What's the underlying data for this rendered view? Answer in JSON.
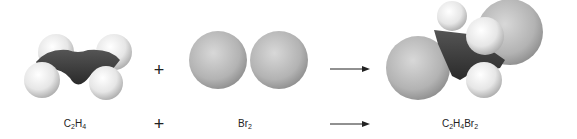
{
  "diagram": {
    "operators": {
      "plus": "+",
      "arrow": "→"
    },
    "reactants": [
      {
        "name": "ethylene",
        "formula_parts": [
          [
            "C",
            ""
          ],
          [
            "2",
            "sub"
          ],
          [
            "H",
            ""
          ],
          [
            "4",
            "sub"
          ]
        ]
      },
      {
        "name": "bromine",
        "formula_parts": [
          [
            "Br",
            ""
          ],
          [
            "2",
            "sub"
          ]
        ]
      }
    ],
    "product": {
      "name": "1,2-dibromoethane",
      "formula_parts": [
        [
          "C",
          ""
        ],
        [
          "2",
          "sub"
        ],
        [
          "H",
          ""
        ],
        [
          "4",
          "sub"
        ],
        [
          "Br",
          ""
        ],
        [
          "2",
          "sub"
        ]
      ]
    },
    "labels": {
      "c2h4": [
        "C",
        "2",
        "H",
        "4"
      ],
      "br2": [
        "Br",
        "2"
      ],
      "c2h4br2": [
        "C",
        "2",
        "H",
        "4",
        "Br",
        "2"
      ]
    },
    "colors": {
      "carbon": "#3a3a3a",
      "hydrogen": "#eeeeee",
      "bromine": "#b5b5b5",
      "text": "#222222"
    }
  }
}
